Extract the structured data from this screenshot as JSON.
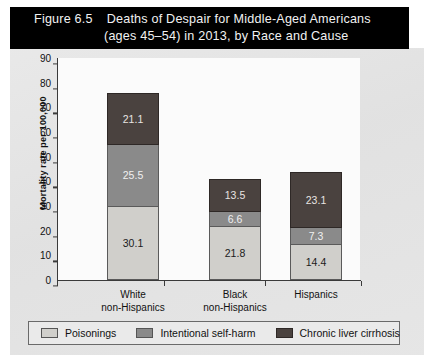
{
  "figure": {
    "number": "Figure 6.5",
    "title_line_1": "Deaths of Despair for Middle-Aged Americans",
    "title_line_2": "(ages 45–54) in 2013, by Race and Cause",
    "banner_color": "#000000",
    "background_color": "#e4e4e4"
  },
  "chart_data": {
    "type": "bar",
    "stacked": true,
    "title": "Deaths of Despair for Middle-Aged Americans (ages 45–54) in 2013, by Race and Cause",
    "xlabel": "",
    "ylabel": "Mortality rate per 100,000",
    "ylim": [
      0,
      90
    ],
    "ytick_step": 10,
    "yticks": [
      "90",
      "80",
      "70",
      "60",
      "50",
      "40",
      "30",
      "20",
      "10",
      "0"
    ],
    "grid": false,
    "legend_position": "bottom",
    "categories": [
      "White non-Hispanics",
      "Black non-Hispanics",
      "Hispanics"
    ],
    "category_lines": [
      [
        "White",
        "non-Hispanics"
      ],
      [
        "Black",
        "non-Hispanics"
      ],
      [
        "Hispanics",
        ""
      ]
    ],
    "series": [
      {
        "name": "Poisonings",
        "color": "#d0cfcb",
        "values": [
          30.1,
          21.8,
          14.4
        ],
        "labels": [
          "30.1",
          "21.8",
          "14.4"
        ]
      },
      {
        "name": "Intentional self-harm",
        "color": "#8a8a8a",
        "values": [
          25.5,
          6.6,
          7.3
        ],
        "labels": [
          "25.5",
          "6.6",
          "7.3"
        ]
      },
      {
        "name": "Chronic liver cirrhosis",
        "color": "#4a423f",
        "values": [
          21.1,
          13.5,
          23.1
        ],
        "labels": [
          "21.1",
          "13.5",
          "23.1"
        ]
      }
    ],
    "totals": [
      76.7,
      41.9,
      44.8
    ]
  },
  "legend": {
    "items": [
      {
        "label": "Poisonings",
        "swatch": "light"
      },
      {
        "label": "Intentional self-harm",
        "swatch": "medium"
      },
      {
        "label": "Chronic liver cirrhosis",
        "swatch": "dark"
      }
    ]
  }
}
